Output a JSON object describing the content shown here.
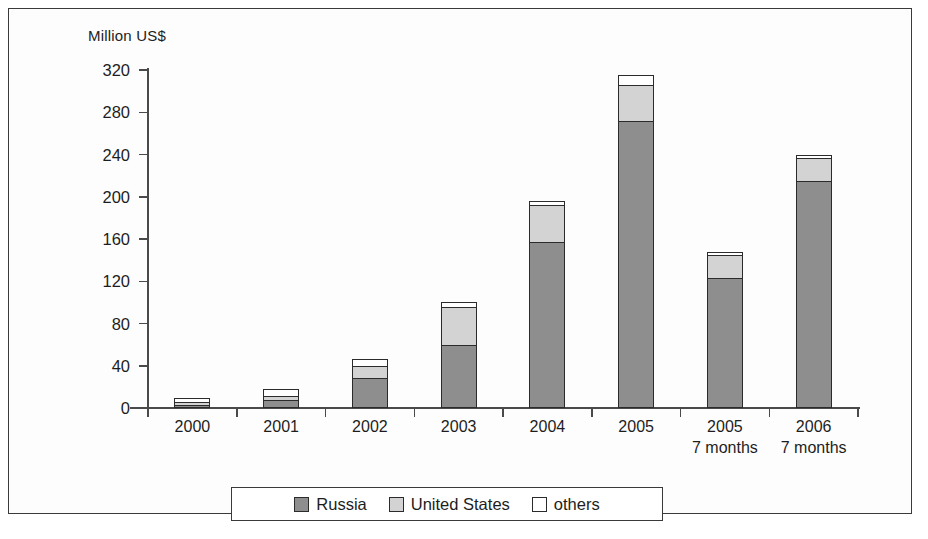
{
  "axis_title": "Million US$",
  "legend": {
    "items": [
      {
        "label": "Russia",
        "color": "#8e8e8e",
        "key": "russia"
      },
      {
        "label": "United States",
        "color": "#d3d3d3",
        "key": "united_states"
      },
      {
        "label": "others",
        "color": "#ffffff",
        "key": "others"
      }
    ]
  },
  "chart_data": {
    "type": "bar",
    "stacked": true,
    "title": "",
    "subtitle": "",
    "xlabel": "",
    "ylabel": "Million US$",
    "ylim": [
      0,
      320
    ],
    "ytick_step": 40,
    "yticks": [
      0,
      40,
      80,
      120,
      160,
      200,
      240,
      280,
      320
    ],
    "ytick_labels": [
      "0",
      "40",
      "80",
      "120",
      "160",
      "200",
      "240",
      "280",
      "320"
    ],
    "grid": false,
    "legend_position": "bottom",
    "categories": [
      "2000",
      "2001",
      "2002",
      "2003",
      "2004",
      "2005",
      "2005",
      "2006"
    ],
    "category_sublabels": [
      "",
      "",
      "",
      "",
      "",
      "",
      "7 months",
      "7 months"
    ],
    "series": [
      {
        "name": "Russia",
        "color": "#8e8e8e",
        "values": [
          3,
          8,
          28,
          60,
          157,
          272,
          123,
          215
        ]
      },
      {
        "name": "United States",
        "color": "#d3d3d3",
        "values": [
          2,
          3,
          12,
          36,
          35,
          34,
          22,
          22
        ]
      },
      {
        "name": "others",
        "color": "#ffffff",
        "values": [
          4,
          7,
          6,
          4,
          4,
          9,
          3,
          3
        ]
      }
    ],
    "totals": [
      9,
      18,
      46,
      100,
      196,
      315,
      148,
      240
    ]
  }
}
